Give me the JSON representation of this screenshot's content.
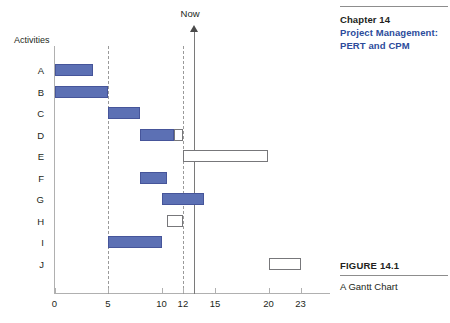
{
  "chapter_head": {
    "chapter_number": "Chapter 14",
    "chapter_title_line1": "Project Management:",
    "chapter_title_line2": "PERT and CPM",
    "accent_color": "#2c4b9b"
  },
  "figure_caption": {
    "label": "FIGURE 14.1",
    "title": "A Gantt Chart"
  },
  "chart_data": {
    "type": "bar",
    "orientation": "horizontal",
    "title": "A Gantt Chart",
    "xlabel": "",
    "ylabel": "Activities",
    "xlim": [
      0,
      25
    ],
    "grid": false,
    "legend": false,
    "bar_color": "#5c70b4",
    "open_bar_color": "#ffffff",
    "axis_title_y": "Activities",
    "xticks": [
      0,
      5,
      10,
      12,
      15,
      20,
      23
    ],
    "xtick_labels": [
      "0",
      "5",
      "10",
      "12",
      "15",
      "20",
      "23"
    ],
    "categories": [
      "A",
      "B",
      "C",
      "D",
      "E",
      "F",
      "G",
      "H",
      "I",
      "J"
    ],
    "annotations": [
      {
        "label": "Now",
        "x": 13,
        "type": "vertical-line-with-arrow"
      }
    ],
    "reference_lines": [
      {
        "x": 5,
        "style": "dashed"
      },
      {
        "x": 12,
        "style": "dashed"
      }
    ],
    "bars": [
      {
        "activity": "A",
        "start": 0,
        "end": 3.6,
        "style": "filled"
      },
      {
        "activity": "B",
        "start": 0,
        "end": 5,
        "style": "filled"
      },
      {
        "activity": "C",
        "start": 5,
        "end": 8,
        "style": "filled"
      },
      {
        "activity": "D",
        "start": 8,
        "end": 11.2,
        "style": "filled"
      },
      {
        "activity": "D",
        "start": 11.2,
        "end": 12,
        "style": "open"
      },
      {
        "activity": "E",
        "start": 12,
        "end": 20,
        "style": "open"
      },
      {
        "activity": "F",
        "start": 8,
        "end": 10.5,
        "style": "filled"
      },
      {
        "activity": "G",
        "start": 10,
        "end": 14,
        "style": "filled"
      },
      {
        "activity": "H",
        "start": 10.5,
        "end": 12,
        "style": "open"
      },
      {
        "activity": "I",
        "start": 5,
        "end": 10,
        "style": "filled"
      },
      {
        "activity": "J",
        "start": 20,
        "end": 23,
        "style": "open"
      }
    ]
  }
}
